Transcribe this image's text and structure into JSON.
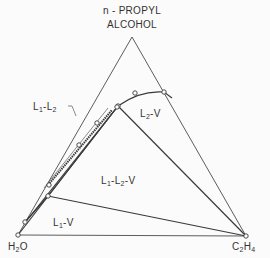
{
  "diagram": {
    "type": "ternary phase diagram",
    "vertices": {
      "top": {
        "line1": "n - PROPYL",
        "line2": "ALCOHOL"
      },
      "bottom_left": {
        "base": "H",
        "sub": "2",
        "rest": "O"
      },
      "bottom_right": {
        "base1": "C",
        "sub1": "2",
        "base2": "H",
        "sub2": "4"
      }
    },
    "regions": [
      {
        "id": "l1-l2",
        "L": "L",
        "s1": "1",
        "mid": "-L",
        "s2": "2"
      },
      {
        "id": "l2-v",
        "L": "L",
        "s1": "2",
        "rest": "-V"
      },
      {
        "id": "l1-l2-v",
        "L": "L",
        "s1": "1",
        "mid": "-L",
        "s2": "2",
        "rest": "-V"
      },
      {
        "id": "l1-v",
        "L": "L",
        "s1": "1",
        "rest": "-V"
      }
    ],
    "colors": {
      "line": "#3a3a3a",
      "text": "#333333",
      "background": "#fbfbfb"
    }
  }
}
